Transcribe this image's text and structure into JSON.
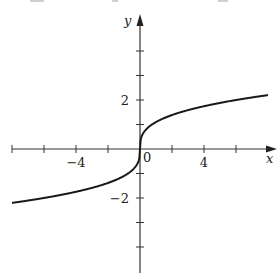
{
  "chart_data": {
    "type": "line",
    "title": "",
    "xlabel": "x",
    "ylabel": "y",
    "xlim": [
      -8,
      8
    ],
    "ylim": [
      -5,
      5.5
    ],
    "x_ticks": [
      -8,
      -6,
      -4,
      -2,
      2,
      4,
      6
    ],
    "y_ticks": [
      -4,
      -3,
      -2,
      -1,
      1,
      2,
      3,
      4
    ],
    "x_tick_labels": [
      {
        "value": -4,
        "text": "−4"
      },
      {
        "value": 4,
        "text": "4"
      }
    ],
    "y_tick_labels": [
      {
        "value": 2,
        "text": "2"
      },
      {
        "value": -2,
        "text": "−2"
      }
    ],
    "origin_label": "0",
    "grid": false,
    "legend": null,
    "series": [
      {
        "name": "curve",
        "description": "odd, increasing cube-root-shaped curve with vertical tangent at origin",
        "x": [
          -8,
          -6,
          -4,
          -2,
          -1,
          -0.5,
          -0.1,
          0,
          0.1,
          0.5,
          1,
          2,
          4,
          6,
          8
        ],
        "y": [
          -2.2,
          -2.0,
          -1.75,
          -1.39,
          -1.1,
          -0.87,
          -0.51,
          0,
          0.51,
          0.87,
          1.1,
          1.39,
          1.75,
          2.0,
          2.2
        ]
      }
    ],
    "colors": {
      "axis": "#333333",
      "curve": "#1a1a1a",
      "background": "#ffffff"
    }
  }
}
